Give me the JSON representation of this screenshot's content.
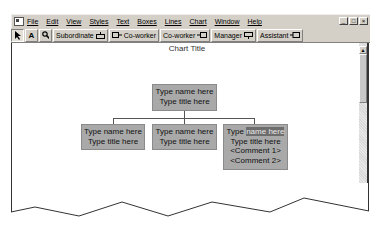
{
  "menubar": {
    "items": [
      "File",
      "Edit",
      "View",
      "Styles",
      "Text",
      "Boxes",
      "Lines",
      "Chart",
      "Window",
      "Help"
    ],
    "window_controls": [
      "minimize",
      "restore",
      "close"
    ]
  },
  "toolbar": {
    "select_tool": "arrow-pointer-icon",
    "text_tool_label": "A",
    "zoom_tool": "magnifier-icon",
    "subordinate_label": "Subordinate",
    "coworker_left_label": "Co-worker",
    "coworker_right_label": "Co-worker",
    "manager_label": "Manager",
    "assistant_label": "Assistant"
  },
  "chart": {
    "title": "Chart Title",
    "root": {
      "name": "Type name here",
      "title": "Type title here"
    },
    "children": [
      {
        "name": "Type name here",
        "title": "Type title here"
      },
      {
        "name": "Type name here",
        "title": "Type title here"
      },
      {
        "name_prefix": "Type ",
        "name_selected": "name here",
        "title": "Type title here",
        "comment1": "<Comment 1>",
        "comment2": "<Comment 2>"
      }
    ],
    "box_color": "#a9a9a9",
    "selection_color": "#6d6d6d"
  }
}
